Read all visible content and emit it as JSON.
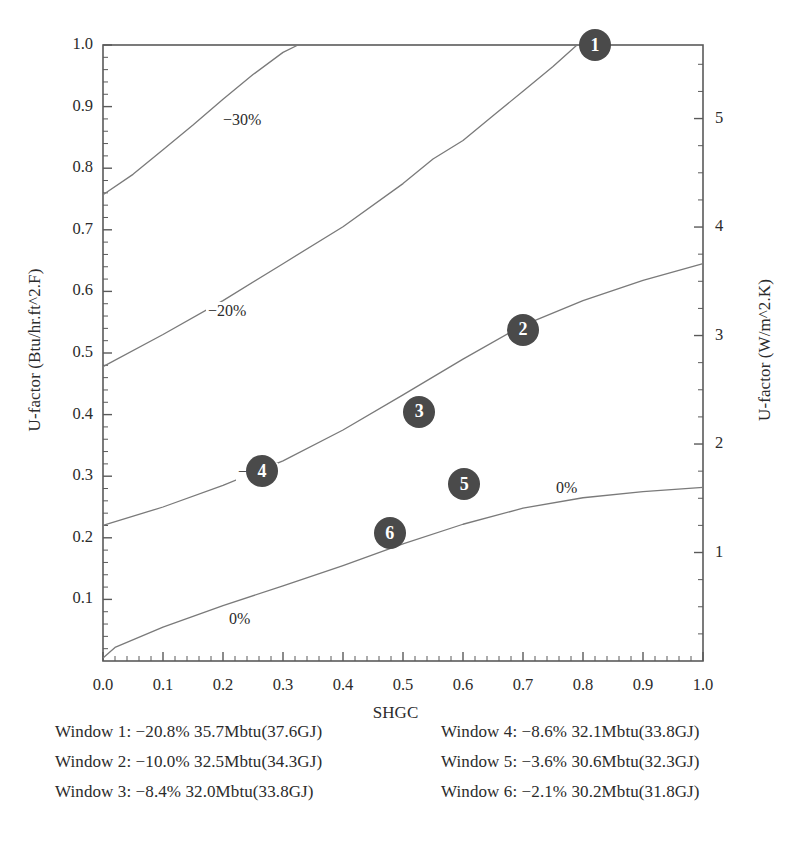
{
  "chart_data": {
    "type": "line",
    "title": "",
    "subtitle": "",
    "xlabel": "SHGC",
    "ylabel": "U-factor (Btu/hr.ft^2.F)",
    "ylabel_right": "U-factor (W/m^2.K)",
    "xlim": [
      0.0,
      1.0
    ],
    "ylim": [
      0.0,
      1.0
    ],
    "ylim_right": [
      0.0,
      5.678
    ],
    "grid": false,
    "legend_position": "below-plot",
    "x_ticks": [
      "0.0",
      "0.1",
      "0.2",
      "0.3",
      "0.4",
      "0.5",
      "0.6",
      "0.7",
      "0.8",
      "0.9",
      "1.0"
    ],
    "x_tick_values": [
      0.0,
      0.1,
      0.2,
      0.3,
      0.4,
      0.5,
      0.6,
      0.7,
      0.8,
      0.9,
      1.0
    ],
    "y_ticks_left": [
      "0.1",
      "0.2",
      "0.3",
      "0.4",
      "0.5",
      "0.6",
      "0.7",
      "0.8",
      "0.9",
      "1.0"
    ],
    "y_tick_values_left": [
      0.1,
      0.2,
      0.3,
      0.4,
      0.5,
      0.6,
      0.7,
      0.8,
      0.9,
      1.0
    ],
    "y_ticks_right": [
      "1",
      "2",
      "3",
      "4",
      "5"
    ],
    "y_tick_values_right": [
      1,
      2,
      3,
      4,
      5
    ],
    "contours": [
      {
        "label": "−30%",
        "level": -30,
        "label_x": 0.2,
        "label_y": 0.875,
        "points": [
          [
            0.0,
            0.757
          ],
          [
            0.05,
            0.79
          ],
          [
            0.1,
            0.83
          ],
          [
            0.15,
            0.87
          ],
          [
            0.2,
            0.912
          ],
          [
            0.25,
            0.952
          ],
          [
            0.3,
            0.988
          ],
          [
            0.325,
            1.0
          ]
        ]
      },
      {
        "label": "−20%",
        "level": -20,
        "label_x": 0.175,
        "label_y": 0.565,
        "points": [
          [
            0.0,
            0.478
          ],
          [
            0.1,
            0.53
          ],
          [
            0.2,
            0.585
          ],
          [
            0.3,
            0.645
          ],
          [
            0.4,
            0.705
          ],
          [
            0.5,
            0.775
          ],
          [
            0.55,
            0.815
          ],
          [
            0.6,
            0.845
          ],
          [
            0.65,
            0.885
          ],
          [
            0.7,
            0.925
          ],
          [
            0.75,
            0.965
          ],
          [
            0.79,
            1.0
          ]
        ]
      },
      {
        "label": "−10%",
        "level": -10,
        "label_x": 0.225,
        "label_y": 0.303,
        "points": [
          [
            0.0,
            0.22
          ],
          [
            0.1,
            0.25
          ],
          [
            0.2,
            0.285
          ],
          [
            0.3,
            0.325
          ],
          [
            0.4,
            0.375
          ],
          [
            0.5,
            0.432
          ],
          [
            0.6,
            0.49
          ],
          [
            0.7,
            0.545
          ],
          [
            0.8,
            0.585
          ],
          [
            0.9,
            0.618
          ],
          [
            1.0,
            0.645
          ]
        ]
      },
      {
        "label": "0%",
        "level": 0,
        "label_x": 0.21,
        "label_y": 0.065,
        "points": [
          [
            0.0,
            0.005
          ],
          [
            0.02,
            0.022
          ],
          [
            0.1,
            0.055
          ],
          [
            0.2,
            0.09
          ],
          [
            0.3,
            0.122
          ],
          [
            0.4,
            0.155
          ],
          [
            0.5,
            0.19
          ],
          [
            0.6,
            0.222
          ],
          [
            0.7,
            0.248
          ],
          [
            0.8,
            0.265
          ],
          [
            0.9,
            0.275
          ],
          [
            1.0,
            0.282
          ]
        ]
      },
      {
        "label": "0%",
        "level": 0,
        "label_x": 0.755,
        "label_y": 0.278,
        "points": []
      }
    ],
    "points": [
      {
        "label": "1",
        "x": 0.82,
        "y": 1.0
      },
      {
        "label": "2",
        "x": 0.7,
        "y": 0.538
      },
      {
        "label": "3",
        "x": 0.527,
        "y": 0.405
      },
      {
        "label": "4",
        "x": 0.265,
        "y": 0.308
      },
      {
        "label": "5",
        "x": 0.602,
        "y": 0.287
      },
      {
        "label": "6",
        "x": 0.478,
        "y": 0.207
      }
    ]
  },
  "axes": {
    "xlabel": "SHGC",
    "ylabel_left": "U-factor (Btu/hr.ft^2.F)",
    "ylabel_right": "U-factor (W/m^2.K)"
  },
  "legend": {
    "entries": [
      {
        "text": "Window 1: −20.8% 35.7Mbtu(37.6GJ)"
      },
      {
        "text": "Window 4: −8.6% 32.1Mbtu(33.8GJ)"
      },
      {
        "text": "Window 2: −10.0% 32.5Mbtu(34.3GJ)"
      },
      {
        "text": "Window 5: −3.6% 30.6Mbtu(32.3GJ)"
      },
      {
        "text": "Window 3: −8.4% 32.0Mbtu(33.8GJ)"
      },
      {
        "text": "Window 6: −2.1% 30.2Mbtu(31.8GJ)"
      }
    ]
  },
  "colors": {
    "marker_fill": "#4a4a4a",
    "marker_text": "#ffffff",
    "axis": "#5a5a5a",
    "contour": "#7a7a7a",
    "text": "#2b2b2b"
  }
}
